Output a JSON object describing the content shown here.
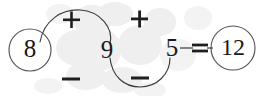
{
  "diagram": {
    "background_color": "#ffffff",
    "ink_color": "#1f1f1f",
    "nodes": [
      {
        "id": "start",
        "label": "8",
        "circled": true,
        "cx": 30,
        "cy": 50,
        "r": 21
      },
      {
        "id": "mid",
        "label": "9",
        "circled": false,
        "cx": 107,
        "cy": 51
      },
      {
        "id": "end",
        "label": "5",
        "circled": false,
        "cx": 172,
        "cy": 49
      },
      {
        "id": "result",
        "label": "12",
        "circled": true,
        "cx": 233,
        "cy": 48,
        "r": 22
      }
    ],
    "operators": [
      {
        "id": "op-1",
        "label": "+",
        "x": 71,
        "y": 20,
        "position": "above-first-arc"
      },
      {
        "id": "op-2",
        "label": "+",
        "x": 139,
        "y": 19,
        "position": "above-second-hump"
      },
      {
        "id": "op-3",
        "label": "−",
        "x": 71,
        "y": 79,
        "position": "below-first-hump"
      },
      {
        "id": "op-4",
        "label": "−",
        "x": 140,
        "y": 78,
        "position": "below-second-arc"
      }
    ],
    "relation": {
      "id": "equals",
      "label": "=",
      "x": 200,
      "y": 48
    },
    "arcs": [
      {
        "id": "arc-up",
        "from": "start",
        "to": "mid",
        "direction": "over",
        "operator": "+"
      },
      {
        "id": "arc-down",
        "from": "mid",
        "to": "end",
        "direction": "under",
        "operator": "−"
      }
    ],
    "equation_reading": "8 + 9 − 5 = 12"
  }
}
